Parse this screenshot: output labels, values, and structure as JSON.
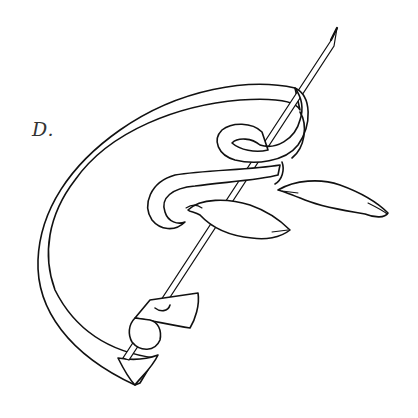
{
  "figure": {
    "label": "D.",
    "colors": {
      "background": "#ffffff",
      "ink": "#111111",
      "label": "#333333"
    }
  }
}
